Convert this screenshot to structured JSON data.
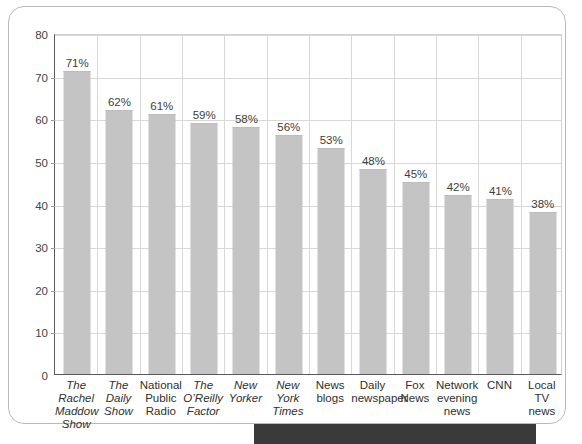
{
  "chart_data": {
    "type": "bar",
    "title": "",
    "subtitle": "",
    "xlabel": "",
    "ylabel": "",
    "ylim": [
      0,
      80
    ],
    "yticks": [
      0,
      10,
      20,
      30,
      40,
      50,
      60,
      70,
      80
    ],
    "grid": true,
    "legend": "none",
    "categories": [
      "The Rachel Maddow Show",
      "The Daily Show",
      "National Public Radio",
      "The O’Reilly Factor",
      "New Yorker",
      "New York Times",
      "News blogs",
      "Daily newspaper",
      "Fox News",
      "Network evening news",
      "CNN",
      "Local TV news"
    ],
    "category_lines": [
      [
        "The Rachel",
        "Maddow",
        "Show"
      ],
      [
        "The",
        "Daily",
        "Show"
      ],
      [
        "National",
        "Public",
        "Radio"
      ],
      [
        "The",
        "O’Reilly",
        "Factor"
      ],
      [
        "New",
        "Yorker"
      ],
      [
        "New",
        "York",
        "Times"
      ],
      [
        "News",
        "blogs"
      ],
      [
        "Daily",
        "newspaper"
      ],
      [
        "Fox",
        "News"
      ],
      [
        "Network",
        "evening",
        "news"
      ],
      [
        "CNN"
      ],
      [
        "Local",
        "TV news"
      ]
    ],
    "category_italic": [
      true,
      true,
      false,
      true,
      true,
      true,
      false,
      false,
      false,
      false,
      false,
      false
    ],
    "values": [
      71,
      62,
      61,
      59,
      58,
      56,
      53,
      48,
      45,
      42,
      41,
      38
    ],
    "value_labels": [
      "71%",
      "62%",
      "61%",
      "59%",
      "58%",
      "56%",
      "53%",
      "48%",
      "45%",
      "42%",
      "41%",
      "38%"
    ],
    "bar_color": "#c4c4c4",
    "grid_color": "#d8d8d8",
    "axis_color": "#5a5a5a",
    "text_color": "#2f2f2f"
  },
  "card": {
    "border_color": "#b9b9b9"
  },
  "bottom_strip": {
    "text": "",
    "background": "#3a3a3a"
  }
}
